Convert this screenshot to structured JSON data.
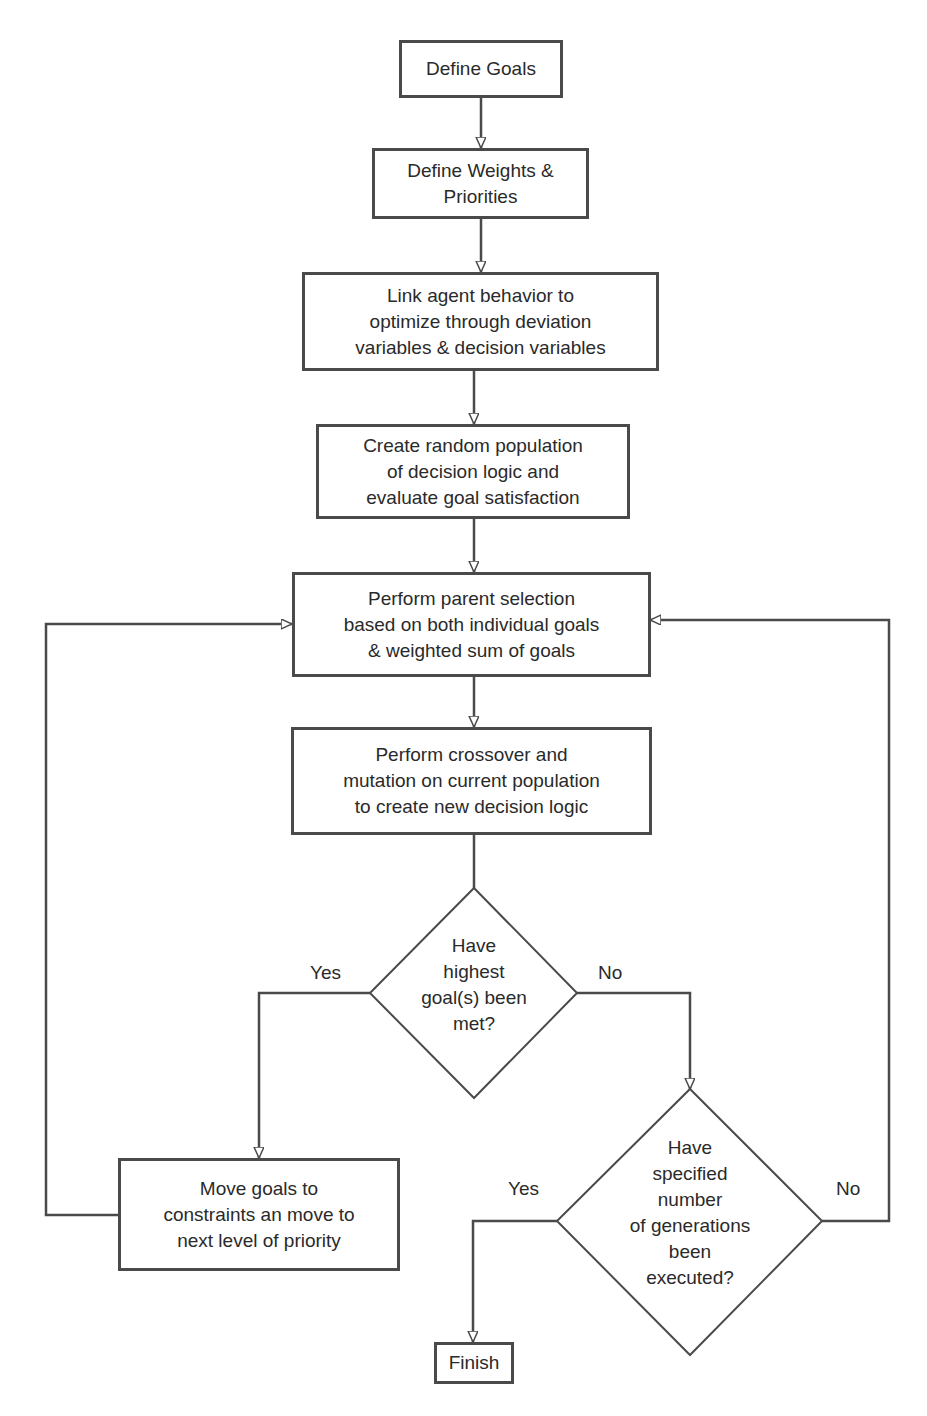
{
  "flowchart": {
    "nodes": {
      "define_goals": "Define Goals",
      "define_weights": "Define Weights &\nPriorities",
      "link_behavior": "Link agent behavior to\noptimize through deviation\nvariables & decision variables",
      "create_population": "Create random population\nof decision logic and\nevaluate goal satisfaction",
      "parent_selection": "Perform parent selection\nbased on both individual goals\n& weighted sum of goals",
      "crossover_mutation": "Perform crossover and\nmutation on current population\nto create new decision logic",
      "decision_goals_met": "Have\nhighest\ngoal(s) been\nmet?",
      "move_goals": "Move goals to\nconstraints an move to\nnext level of priority",
      "decision_generations": "Have\nspecified\nnumber\nof generations\nbeen\nexecuted?",
      "finish": "Finish"
    },
    "labels": {
      "goals_met_yes": "Yes",
      "goals_met_no": "No",
      "generations_yes": "Yes",
      "generations_no": "No"
    },
    "colors": {
      "stroke": "#4a4a4a",
      "text": "#2a2a2a",
      "background": "#ffffff"
    }
  }
}
